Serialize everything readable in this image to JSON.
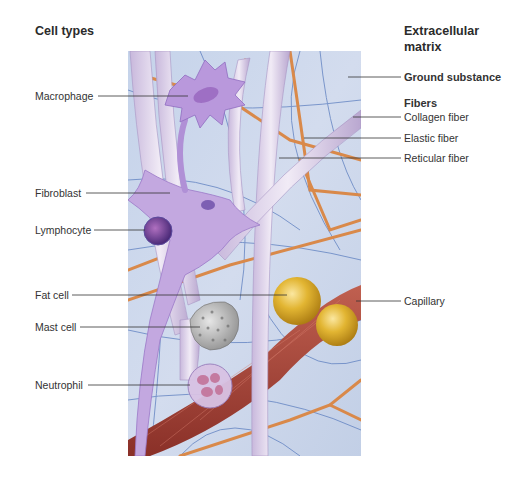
{
  "figure": {
    "left_heading": "Cell types",
    "right_heading_line1": "Extracellular",
    "right_heading_line2": "matrix",
    "cell_types": [
      {
        "label": "Macrophage"
      },
      {
        "label": "Fibroblast"
      },
      {
        "label": "Lymphocyte"
      },
      {
        "label": "Fat cell"
      },
      {
        "label": "Mast cell"
      },
      {
        "label": "Neutrophil"
      }
    ],
    "matrix": {
      "ground_substance": "Ground substance",
      "fibers_heading": "Fibers",
      "fibers": [
        {
          "label": "Collagen fiber"
        },
        {
          "label": "Elastic fiber"
        },
        {
          "label": "Reticular fiber"
        }
      ],
      "capillary": "Capillary"
    },
    "colors": {
      "background_tissue": "#c9d6ea",
      "collagen": "#e4dcec",
      "elastic": "#d9894a",
      "reticular": "#5d7fc0",
      "cell_purple": "#b89ad6",
      "fat": "#dcae2a",
      "capillary": "#a8453a",
      "mast": "#b8b8b8"
    }
  }
}
